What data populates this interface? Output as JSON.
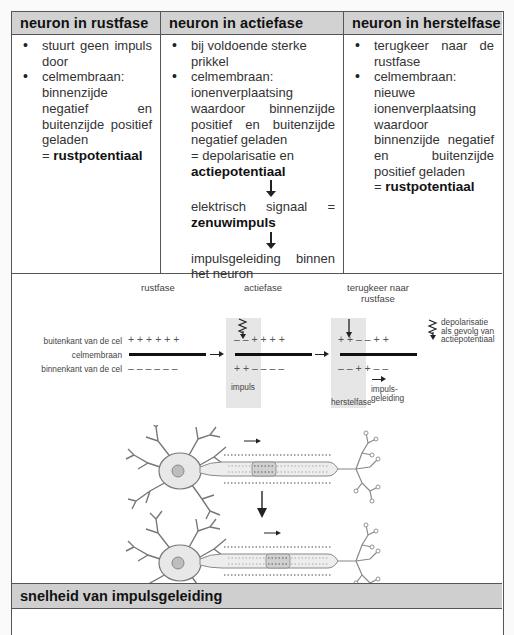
{
  "table": {
    "columns": [
      {
        "header": "neuron in rustfase",
        "items": [
          {
            "text": "stuurt geen impuls door"
          },
          {
            "lead": "celmembraan:",
            "text": "binnenzijde negatief en buitenzijde positief geladen",
            "result_prefix": "= ",
            "result_bold": "rustpotentiaal"
          }
        ]
      },
      {
        "header": "neuron in actiefase",
        "items": [
          {
            "text": "bij voldoende sterke prikkel"
          },
          {
            "lead": "celmembraan:",
            "text": "ionenverplaatsing waardoor binnenzijde positief en buitenzijde negatief geladen",
            "result_prefix": "= depolarisatie en ",
            "result_bold": "actiepotentiaal"
          }
        ],
        "chain": [
          {
            "prefix": "elektrisch signaal = ",
            "bold": "zenuwimpuls"
          },
          {
            "prefix": "impulsgeleiding binnen het neuron",
            "bold": ""
          }
        ]
      },
      {
        "header": "neuron in herstelfase",
        "items": [
          {
            "text": "terugkeer naar de rustfase"
          },
          {
            "lead": "celmembraan:",
            "text": "nieuwe ionenverplaatsing waardoor binnenzijde negatief en buitenzijde positief geladen",
            "result_prefix": "= ",
            "result_bold": "rustpotentiaal"
          }
        ]
      }
    ]
  },
  "diagram": {
    "phase_titles": {
      "rest": "rustfase",
      "action": "actiefase",
      "recovery_line1": "terugkeer naar",
      "recovery_line2": "rustfase"
    },
    "row_labels": {
      "outside": "buitenkant van de cel",
      "membrane": "celmembraan",
      "inside": "binnenkant van de cel"
    },
    "rest": {
      "outside": "+   +   +   +   +   +",
      "inside": "–   –   –   –   –   –"
    },
    "action": {
      "outside": "–   –   +   +   +   +",
      "inside": "+   +   –   –   –   –",
      "zone_label": "impuls"
    },
    "recovery": {
      "outside": "+   +   –   –   +   +",
      "inside": "–   –   +   +   –   –",
      "zone_label": "herstelfase",
      "conduction_label_1": "impuls-",
      "conduction_label_2": "geleiding"
    },
    "legend": {
      "line1": "depolarisatie",
      "line2": "als gevolg van",
      "line3": "actiepotentiaal"
    }
  },
  "section": {
    "title": "snelheid van impulsgeleiding"
  }
}
